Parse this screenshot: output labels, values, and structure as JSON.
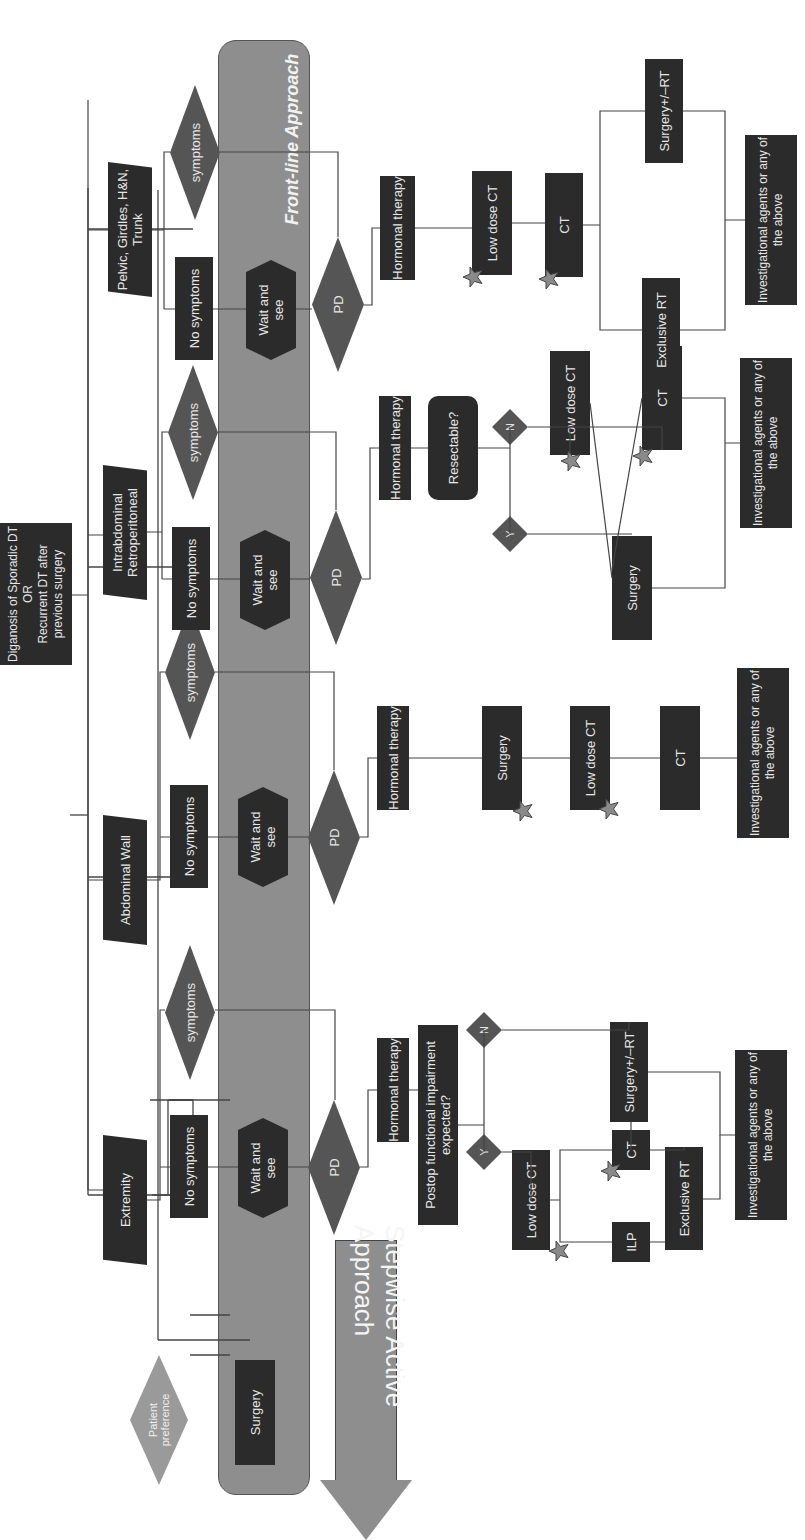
{
  "root": {
    "label": "Diganosis of Sporadic DT\nOR\nRecurrent DT after previous surgery"
  },
  "patient_preference": {
    "label": "Patient preference",
    "surgery": "Surgery"
  },
  "bands": {
    "front_line": "Front-line Approach",
    "stepwise": "Stepwise Active Approach"
  },
  "sites": [
    {
      "name": "Extremity",
      "no_symptoms": "No symptoms",
      "symptoms": "symptoms",
      "wait": "Wait and see",
      "pd": "PD",
      "hormonal": "Hormonal therapy",
      "question": "Postop functional impairment expected?",
      "yes": "Y",
      "no": "N",
      "steps_yes": [
        "Low dose CT",
        "ILP",
        "CT",
        "Exclusive RT"
      ],
      "steps_no": [
        "Surgery+/–RT"
      ],
      "final": "Investigational agents or any of the above"
    },
    {
      "name": "Abdominal Wall",
      "no_symptoms": "No symptoms",
      "symptoms": "symptoms",
      "wait": "Wait and see",
      "pd": "PD",
      "hormonal": "Hormonal therapy",
      "steps": [
        "Surgery",
        "Low dose CT",
        "CT"
      ],
      "final": "Investigational agents or any of the above"
    },
    {
      "name": "Intrabdominal Retroperitoneal",
      "no_symptoms": "No symptoms",
      "symptoms": "symptoms",
      "wait": "Wait and see",
      "pd": "PD",
      "hormonal": "Hormonal therapy",
      "question": "Resectable?",
      "yes": "Y",
      "no": "N",
      "steps_yes": [
        "Surgery"
      ],
      "steps_no": [
        "Low dose CT",
        "CT"
      ],
      "final": "Investigational agents or any of the above"
    },
    {
      "name": "Pelvic, Girdles, H&N, Trunk",
      "name_superscript": "a",
      "no_symptoms": "No symptoms",
      "symptoms": "symptoms",
      "wait": "Wait and see",
      "pd": "PD",
      "hormonal": "Hormonal therapy",
      "steps": [
        "Low dose CT",
        "CT",
        "Exclusive RT",
        "Surgery+/–RT"
      ],
      "final": "Investigational agents or any of the above"
    }
  ],
  "colors": {
    "dark_box": "#2b2b2b",
    "diamond": "#555555",
    "band": "#8e8e8e",
    "light_diamond": "#9a9a9a",
    "star": "#8a8a8a",
    "line": "#444444"
  }
}
